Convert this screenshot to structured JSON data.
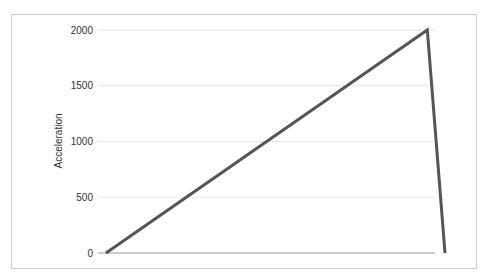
{
  "chart_data": {
    "type": "line",
    "title": "",
    "xlabel": "",
    "ylabel": "Acceleration",
    "ylim": [
      0,
      2000
    ],
    "yticks": [
      0,
      500,
      1000,
      1500,
      2000
    ],
    "grid": true,
    "legend": null,
    "series": [
      {
        "name": "Acceleration",
        "color": "#555555",
        "points": [
          {
            "x": 0,
            "y": 0
          },
          {
            "x": 0.905,
            "y": 2000
          },
          {
            "x": 0.955,
            "y": 0
          }
        ]
      }
    ]
  },
  "labels": {
    "ylabel": "Acceleration",
    "ticks": [
      "0",
      "500",
      "1000",
      "1500",
      "2000"
    ]
  }
}
